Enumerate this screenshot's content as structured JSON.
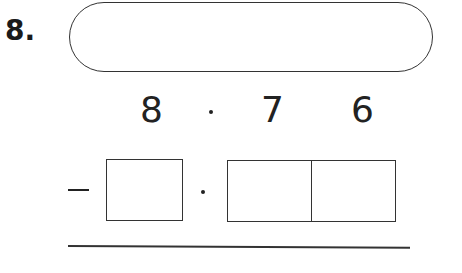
{
  "question": {
    "number": "8.",
    "answer_pill": "",
    "subtraction": {
      "minuend": {
        "ones": "8",
        "decimal_point": "·",
        "tenths": "7",
        "hundredths": "6"
      },
      "operator": "−",
      "subtrahend_boxes": {
        "ones": "",
        "tenths": "",
        "hundredths": ""
      }
    }
  }
}
